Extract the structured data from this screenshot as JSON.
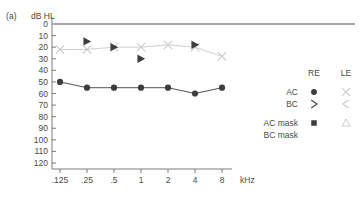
{
  "panel": {
    "letter": "(a)"
  },
  "axes": {
    "y_unit_label": "dB HL",
    "x_unit_label": "kHz",
    "y_ticks": [
      0,
      10,
      20,
      30,
      40,
      50,
      60,
      70,
      80,
      90,
      100,
      110,
      120
    ],
    "y_tick_labels": [
      "0",
      "10",
      "20",
      "30",
      "40",
      "50",
      "60",
      "70",
      "80",
      "90",
      "100",
      "110",
      "120"
    ],
    "x_tick_labels": [
      ".125",
      ".25",
      ".5",
      "1",
      "2",
      "4",
      "8"
    ],
    "ylim": [
      0,
      120
    ],
    "grid": false
  },
  "colors": {
    "right_ear": "#3d3d3d",
    "left_ear": "#c9c9c9",
    "axis": "#6e6e6e",
    "zero_line": "#8a8a8a",
    "text": "#4a4a4a"
  },
  "legend": {
    "col_headers": [
      "RE",
      "LE"
    ],
    "rows": [
      {
        "label": "AC",
        "re_symbol": "filled-circle",
        "le_symbol": "cross-x"
      },
      {
        "label": "BC",
        "re_symbol": "angle-right",
        "le_symbol": "angle-left"
      },
      {
        "label": "AC mask",
        "re_symbol": "filled-square",
        "le_symbol": "open-triangle-up"
      },
      {
        "label": "BC mask",
        "re_symbol": "filled-triangle-right",
        "le_symbol": "open-triangle-left"
      }
    ]
  },
  "chart_data": {
    "type": "line",
    "title": "",
    "xlabel": "kHz",
    "ylabel": "dB HL",
    "x": [
      0.125,
      0.25,
      0.5,
      1,
      2,
      4,
      8
    ],
    "x_tick_labels": [
      ".125",
      ".25",
      ".5",
      "1",
      "2",
      "4",
      "8"
    ],
    "ylim": [
      0,
      120
    ],
    "y_inverted": true,
    "grid": false,
    "zero_reference_line": 0,
    "series": [
      {
        "name": "AC mask RE",
        "symbol": "filled-circle",
        "color": "#3d3d3d",
        "connected": true,
        "values": [
          50,
          55,
          55,
          55,
          55,
          60,
          55
        ]
      },
      {
        "name": "AC LE",
        "symbol": "cross-x",
        "color": "#c9c9c9",
        "connected": true,
        "values": [
          22,
          22,
          20,
          20,
          18,
          20,
          28
        ]
      },
      {
        "name": "BC mask RE",
        "symbol": "filled-triangle-right",
        "color": "#3d3d3d",
        "connected": false,
        "values": [
          null,
          15,
          20,
          30,
          null,
          18,
          null
        ]
      }
    ]
  }
}
